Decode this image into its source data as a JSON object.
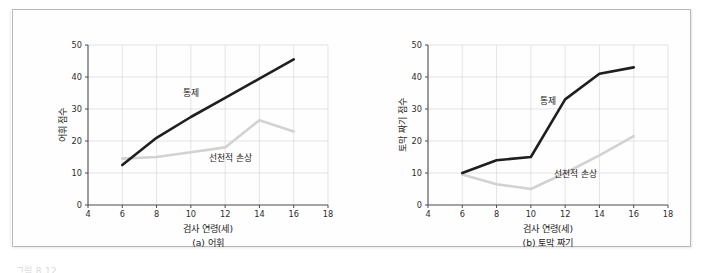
{
  "figure": {
    "bottom_caption_partial": "그림 8.12",
    "border_color": "#b9b9b9",
    "background_color": "#fefefe"
  },
  "colors": {
    "control_line": "#1f1f1f",
    "congenital_line": "#d2d2d2",
    "gridline": "#d8d8d8",
    "axis": "#4a4a4a",
    "text": "#1a1a1a"
  },
  "chart_data": [
    {
      "type": "line",
      "panel_id": "a",
      "title": "(a) 어휘",
      "xlabel": "검사 연령(세)",
      "ylabel": "어휘 점수",
      "xlim": [
        4,
        18
      ],
      "ylim": [
        0,
        50
      ],
      "xticks": [
        4,
        6,
        8,
        10,
        12,
        14,
        16,
        18
      ],
      "yticks": [
        0,
        10,
        20,
        30,
        40,
        50
      ],
      "grid": true,
      "legend": "inline-annotations",
      "x": [
        6,
        8,
        10,
        12,
        14,
        16
      ],
      "series": [
        {
          "name": "통제",
          "color": "#1f1f1f",
          "values": [
            12.5,
            21.0,
            27.5,
            33.5,
            39.5,
            45.5
          ]
        },
        {
          "name": "선천적 손상",
          "color": "#d2d2d2",
          "values": [
            14.5,
            15.0,
            16.5,
            18.0,
            26.5,
            23.0
          ]
        }
      ],
      "annotations": [
        {
          "text": "통제",
          "x": 10.0,
          "y": 34.0
        },
        {
          "text": "선천적 손상",
          "x": 12.3,
          "y": 13.8
        }
      ]
    },
    {
      "type": "line",
      "panel_id": "b",
      "title": "(b) 토막 짜기",
      "xlabel": "검사 연령(세)",
      "ylabel": "토막 짜기 점수",
      "xlim": [
        4,
        18
      ],
      "ylim": [
        0,
        50
      ],
      "xticks": [
        4,
        6,
        8,
        10,
        12,
        14,
        16,
        18
      ],
      "yticks": [
        0,
        10,
        20,
        30,
        40,
        50
      ],
      "grid": true,
      "legend": "inline-annotations",
      "x": [
        6,
        8,
        10,
        12,
        14,
        16
      ],
      "series": [
        {
          "name": "통제",
          "color": "#1f1f1f",
          "values": [
            10.0,
            14.0,
            15.0,
            33.0,
            41.0,
            43.0
          ]
        },
        {
          "name": "선천적 손상",
          "color": "#d2d2d2",
          "values": [
            9.5,
            6.5,
            5.0,
            10.0,
            15.5,
            21.5
          ]
        }
      ],
      "annotations": [
        {
          "text": "통제",
          "x": 11.0,
          "y": 31.5
        },
        {
          "text": "선천적 손상",
          "x": 12.6,
          "y": 8.6
        }
      ]
    }
  ]
}
